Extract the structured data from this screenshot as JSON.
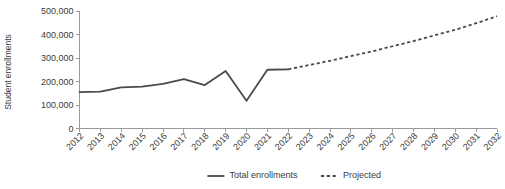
{
  "chart_data": {
    "type": "line",
    "title": "",
    "xlabel": "",
    "ylabel": "Student enrollments",
    "x": [
      2012,
      2013,
      2014,
      2015,
      2016,
      2017,
      2018,
      2019,
      2020,
      2021,
      2022,
      2023,
      2024,
      2025,
      2026,
      2027,
      2028,
      2029,
      2030,
      2031,
      2032
    ],
    "xtick_labels": [
      "2012",
      "2013",
      "2014",
      "2015",
      "2016",
      "2017",
      "2018",
      "2019",
      "2020",
      "2021",
      "2022",
      "2023",
      "2024",
      "2025",
      "2026",
      "2027",
      "2028",
      "2029",
      "2030",
      "2031",
      "2032"
    ],
    "ytick_labels": [
      "0",
      "100,000",
      "200,000",
      "300,000",
      "400,000",
      "500,000"
    ],
    "ytick_values": [
      0,
      100000,
      200000,
      300000,
      400000,
      500000
    ],
    "ylim": [
      0,
      500000
    ],
    "xlim": [
      2012,
      2032
    ],
    "grid": false,
    "legend_position": "bottom-center",
    "series": [
      {
        "name": "Total enrollments",
        "style": "solid",
        "color": "#4a4a4a",
        "x": [
          2012,
          2013,
          2014,
          2015,
          2016,
          2017,
          2018,
          2019,
          2020,
          2021,
          2022
        ],
        "values": [
          155000,
          157000,
          175000,
          178000,
          190000,
          210000,
          185000,
          245000,
          118000,
          250000,
          252000
        ]
      },
      {
        "name": "Projected",
        "style": "dashed",
        "color": "#4a4a4a",
        "x": [
          2022,
          2023,
          2024,
          2025,
          2026,
          2027,
          2028,
          2029,
          2030,
          2031,
          2032
        ],
        "values": [
          252000,
          270000,
          288000,
          308000,
          328000,
          350000,
          372000,
          396000,
          420000,
          448000,
          478000
        ]
      }
    ],
    "legend": [
      {
        "label": "Total enrollments",
        "style": "solid",
        "color": "#4a4a4a"
      },
      {
        "label": "Projected",
        "style": "dashed",
        "color": "#4a4a4a"
      }
    ]
  },
  "colors": {
    "series": "#4a4a4a",
    "axis": "#9a9a9a",
    "text": "#3b3b3b",
    "background": "#ffffff"
  }
}
